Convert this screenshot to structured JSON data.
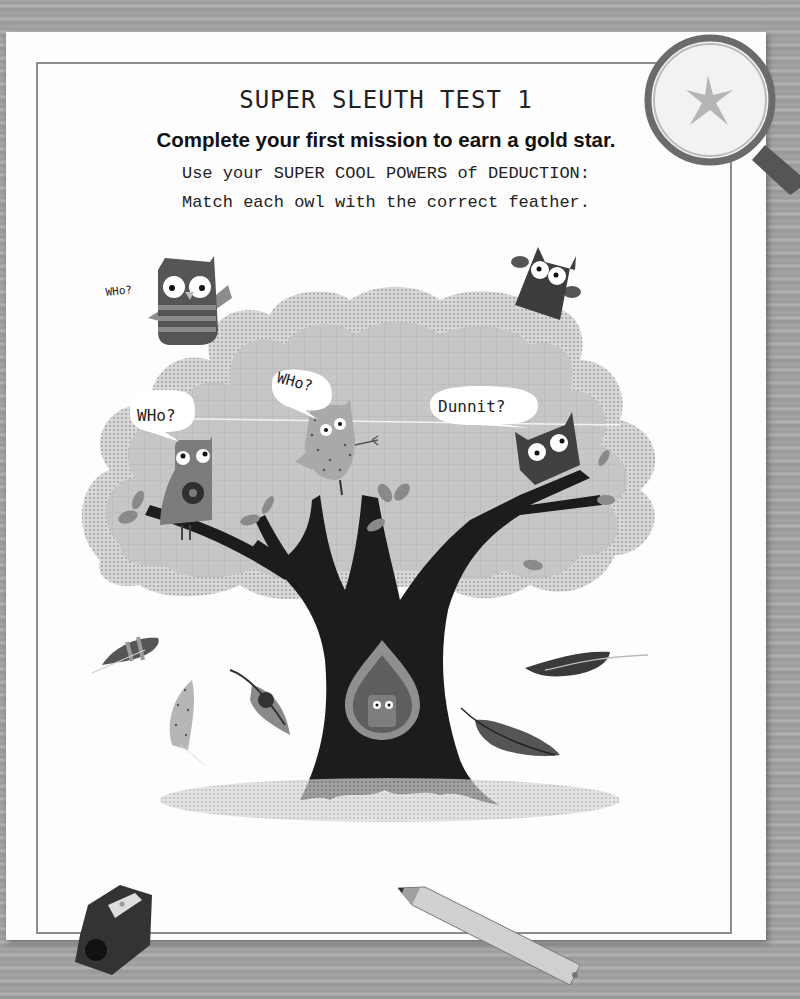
{
  "page": {
    "title": "SUPER SLEUTH TEST 1",
    "subtitle": "Complete your first mission to earn a gold star.",
    "instructions": [
      "Use your SUPER COOL POWERS of DEDUCTION:",
      "Match each owl with the correct feather."
    ]
  },
  "speech_bubbles": [
    {
      "id": "top-left",
      "text": "WHo?"
    },
    {
      "id": "left",
      "text": "WHo?"
    },
    {
      "id": "center",
      "text": "WHo?"
    },
    {
      "id": "right",
      "text": "Dunnit?"
    }
  ],
  "owls": [
    {
      "id": "striped-owl",
      "style": "striped"
    },
    {
      "id": "flower-owl",
      "style": "flower"
    },
    {
      "id": "dotted-owl",
      "style": "dotted"
    },
    {
      "id": "dark-top-owl",
      "style": "dark"
    },
    {
      "id": "dark-branch-owl",
      "style": "dark"
    },
    {
      "id": "hollow-owl",
      "style": "small"
    }
  ],
  "feathers": [
    {
      "id": "striped-feather"
    },
    {
      "id": "dotted-feather"
    },
    {
      "id": "flower-feather"
    },
    {
      "id": "dark-feather-top"
    },
    {
      "id": "dark-feather-bottom"
    }
  ],
  "decorations": [
    "magnifying-glass",
    "star",
    "pencil-sharpener",
    "pencil"
  ],
  "colors": {
    "paper": "#fdfdfd",
    "tree": "#1a1a1a",
    "foliage": "#c4c4c4",
    "wood": "#a3a3a3"
  }
}
